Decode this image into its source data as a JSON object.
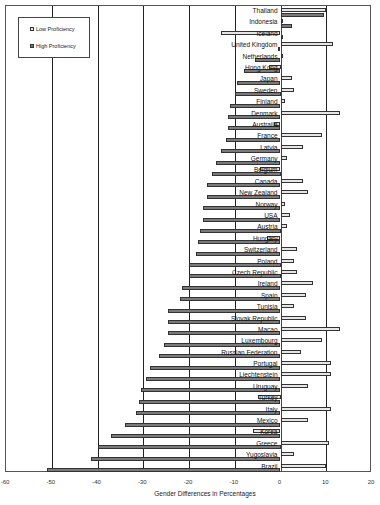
{
  "chart_data": {
    "type": "bar",
    "orientation": "horizontal",
    "title": "",
    "xlabel": "Gender Differences in Percentages",
    "ylabel": "",
    "xlim": [
      -60,
      20
    ],
    "x_ticks": [
      "-60",
      "-50",
      "-40",
      "-30",
      "-20",
      "-10",
      "0",
      "10",
      "20"
    ],
    "grid": true,
    "legend_position": "upper-left",
    "categories": [
      "Thailand",
      "Indonesia",
      "Iceland",
      "United Kingdom",
      "Netherlands",
      "Hong Kong",
      "Japan",
      "Sweden",
      "Finland",
      "Denmark",
      "Australia",
      "France",
      "Latvia",
      "Germany",
      "Belgium",
      "Canada",
      "New Zealand",
      "Norway",
      "USA",
      "Austria",
      "Hungary",
      "Switzerland",
      "Poland",
      "Czech Republic",
      "Ireland",
      "Spain",
      "Tunisia",
      "Slovak Republic",
      "Macao",
      "Luxembourg",
      "Russian Federation",
      "Portugal",
      "Liechtenstein",
      "Uruguay",
      "Turkey",
      "Italy",
      "Mexico",
      "Korea",
      "Greece",
      "Yugoslavia",
      "Brazil"
    ],
    "series": [
      {
        "name": "Low Proficiency",
        "color": "#e6e6e6",
        "values": [
          10,
          0.5,
          -13,
          11.5,
          0.5,
          -2.5,
          2.5,
          3,
          1,
          13,
          -1.5,
          9,
          5,
          1.5,
          -4.5,
          5,
          6,
          1,
          2,
          1.5,
          -3,
          3.5,
          3,
          3.5,
          7,
          5.5,
          3,
          5.5,
          13,
          9,
          4.5,
          11,
          11,
          6,
          -5,
          11,
          6,
          -6,
          10.5,
          3,
          10
        ]
      },
      {
        "name": "High Proficiency",
        "color": "#7a7a7a",
        "values": [
          9.5,
          2.5,
          0,
          -0.5,
          -5.5,
          -8,
          -9.5,
          -10,
          -11,
          -11.5,
          -11.5,
          -12,
          -13,
          -14,
          -15,
          -16,
          -16,
          -17,
          -17,
          -17.5,
          -18,
          -18.5,
          -20,
          -20,
          -21.5,
          -22,
          -24.5,
          -24.5,
          -24.5,
          -25.5,
          -26.5,
          -28.5,
          -29.5,
          -30.5,
          -31,
          -31.5,
          -34,
          -37,
          -40,
          -41.5,
          -51
        ]
      }
    ]
  },
  "legend": {
    "items": [
      {
        "label": "Low Proficiency"
      },
      {
        "label": "High Proficiency"
      }
    ]
  }
}
